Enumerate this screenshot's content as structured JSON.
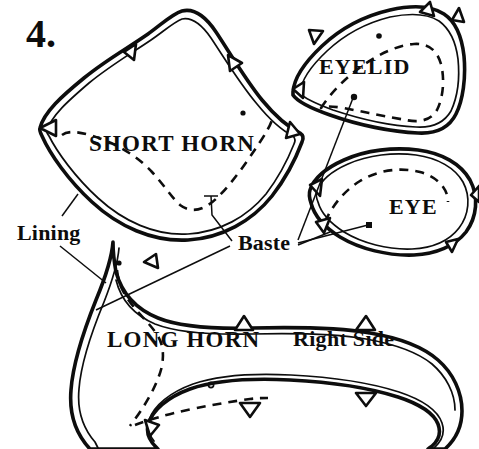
{
  "figure": {
    "step_number": "4.",
    "kind": "sewing-pattern-diagram",
    "background_color": "#ffffff",
    "ink_color": "#0d0d0d"
  },
  "pieces": [
    {
      "id": "short-horn",
      "label": "SHORT HORN",
      "has_seam_allowance_line": true,
      "has_basting_dashed_line": true,
      "notch_count": 4
    },
    {
      "id": "eyelid",
      "label": "EYELID",
      "has_seam_allowance_line": true,
      "has_basting_dashed_line": true,
      "notch_count": 4
    },
    {
      "id": "eye",
      "label": "EYE",
      "has_seam_allowance_line": true,
      "has_basting_dashed_line": true,
      "notch_count": 4
    },
    {
      "id": "long-horn",
      "label": "LONG HORN",
      "side_label": "Right Side",
      "has_seam_allowance_line": true,
      "has_basting_dashed_line": true,
      "notch_count": 6
    }
  ],
  "annotations": [
    {
      "id": "lining",
      "label": "Lining",
      "points_to": [
        "short-horn-edge",
        "long-horn-edge"
      ]
    },
    {
      "id": "baste",
      "label": "Baste",
      "points_to": [
        "short-horn-stitch",
        "long-horn-stitch",
        "eyelid-stitch",
        "eye-stitch"
      ]
    }
  ]
}
